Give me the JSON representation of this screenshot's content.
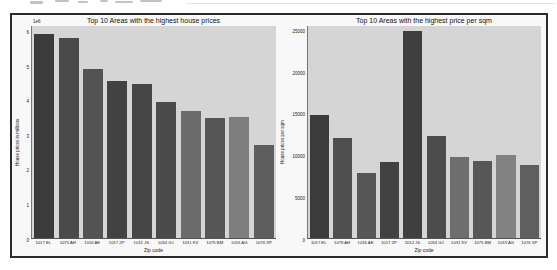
{
  "figure": {
    "background": "#f8f8f8",
    "border_color": "#2b2b2b",
    "plot_background": "#d5d5d5"
  },
  "chart_data": [
    {
      "type": "bar",
      "title": "Top 10 Areas with the highest house prices",
      "xlabel": "Zip code",
      "ylabel": "House prices in millions",
      "offset_label": "1e6",
      "categories": [
        "1017 EL",
        "1075 AH",
        "1016 AE",
        "1017 ZP",
        "1012 JS",
        "1054 GJ",
        "1031 KV",
        "1075 BM",
        "1015 AG",
        "1076 XP"
      ],
      "values": [
        6000000,
        5880000,
        4950000,
        4600000,
        4520000,
        4000000,
        3730000,
        3530000,
        3550000,
        2720000
      ],
      "ylim": [
        0,
        6220000
      ],
      "yticks": [
        0,
        1000000,
        2000000,
        3000000,
        4000000,
        5000000,
        6000000
      ],
      "ytick_labels": [
        "0",
        "1",
        "2",
        "3",
        "4",
        "5",
        "6"
      ],
      "grid": false,
      "legend": "none",
      "bar_colors": [
        "#3b3b3b",
        "#4a4a4a",
        "#535353",
        "#424242",
        "#464646",
        "#4a4a4a",
        "#6b6b6b",
        "#565656",
        "#7e7e7e",
        "#5e5e5e"
      ]
    },
    {
      "type": "bar",
      "title": "Top 10 Areas with the highest price per sqm",
      "xlabel": "Zip code",
      "ylabel": "House prices per sqm",
      "offset_label": "",
      "categories": [
        "1017 EL",
        "1079 AH",
        "1016 AE",
        "1017 ZP",
        "1012 JS",
        "1054 GJ",
        "1031 KV",
        "1075 BM",
        "1015 AG",
        "1076 XP"
      ],
      "values": [
        15000,
        12200,
        7900,
        9250,
        25150,
        12450,
        9900,
        9400,
        10100,
        8900
      ],
      "ylim": [
        0,
        25760
      ],
      "yticks": [
        0,
        5000,
        10000,
        15000,
        20000,
        25000
      ],
      "ytick_labels": [
        "0",
        "5000",
        "10000",
        "15000",
        "20000",
        "25000"
      ],
      "grid": false,
      "legend": "none",
      "bar_colors": [
        "#3b3b3b",
        "#4f4f4f",
        "#565656",
        "#424242",
        "#3f3f3f",
        "#4c4c4c",
        "#6e6e6e",
        "#575757",
        "#828282",
        "#5f5f5f"
      ]
    }
  ]
}
